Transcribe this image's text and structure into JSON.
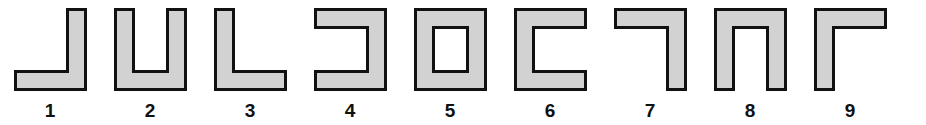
{
  "figure": {
    "background_color": "#ffffff",
    "shape_fill_color": "#d2d2d2",
    "shape_stroke_color": "#111111",
    "label_color": "#111111",
    "stroke_width": 3,
    "bar_thickness": 18,
    "shape_width": 70,
    "shape_height": 80
  },
  "shapes": [
    {
      "number": "1",
      "name": "j-shape",
      "description": "vertical bar on right with foot extending to the left at the bottom",
      "orientation": "opens-up-left",
      "path": "M 52 0 L 70 0 L 70 80 L 0 80 L 0 62 L 52 62 Z"
    },
    {
      "number": "2",
      "name": "u-shape",
      "description": "two vertical bars joined by a bottom bar, opening upward",
      "orientation": "opens-up",
      "path": "M 0 0 L 18 0 L 18 62 L 52 62 L 52 0 L 70 0 L 70 80 L 0 80 Z"
    },
    {
      "number": "3",
      "name": "l-shape",
      "description": "vertical bar on left with foot extending to the right at the bottom",
      "orientation": "opens-up-right",
      "path": "M 0 0 L 18 0 L 18 62 L 70 62 L 70 80 L 0 80 Z"
    },
    {
      "number": "4",
      "name": "bracket-open-left-shape",
      "description": "top bar, right vertical bar and bottom bar, opening to the left",
      "orientation": "opens-left",
      "path": "M 0 0 L 70 0 L 70 80 L 0 80 L 0 62 L 52 62 L 52 18 L 0 18 Z"
    },
    {
      "number": "5",
      "name": "square-frame-shape",
      "description": "closed square frame with a square hole in the middle",
      "orientation": "closed",
      "path": "M 0 0 L 70 0 L 70 80 L 0 80 Z M 18 18 L 18 62 L 52 62 L 52 18 Z"
    },
    {
      "number": "6",
      "name": "bracket-open-right-shape",
      "description": "top bar, left vertical bar and bottom bar, opening to the right",
      "orientation": "opens-right",
      "path": "M 0 0 L 70 0 L 70 18 L 18 18 L 18 62 L 70 62 L 70 80 L 0 80 Z"
    },
    {
      "number": "7",
      "name": "mirrored-l-shape",
      "description": "top bar with a vertical bar descending on the right",
      "orientation": "opens-down-left",
      "path": "M 0 0 L 70 0 L 70 80 L 52 80 L 52 18 L 0 18 Z"
    },
    {
      "number": "8",
      "name": "inverted-u-shape",
      "description": "two vertical bars joined by a top bar, opening downward",
      "orientation": "opens-down",
      "path": "M 0 0 L 70 0 L 70 80 L 52 80 L 52 18 L 18 18 L 18 80 L 0 80 Z"
    },
    {
      "number": "9",
      "name": "gamma-shape",
      "description": "vertical bar on left with top bar extending to the right",
      "orientation": "opens-down-right",
      "path": "M 0 0 L 70 0 L 70 18 L 18 18 L 18 80 L 0 80 Z"
    }
  ]
}
